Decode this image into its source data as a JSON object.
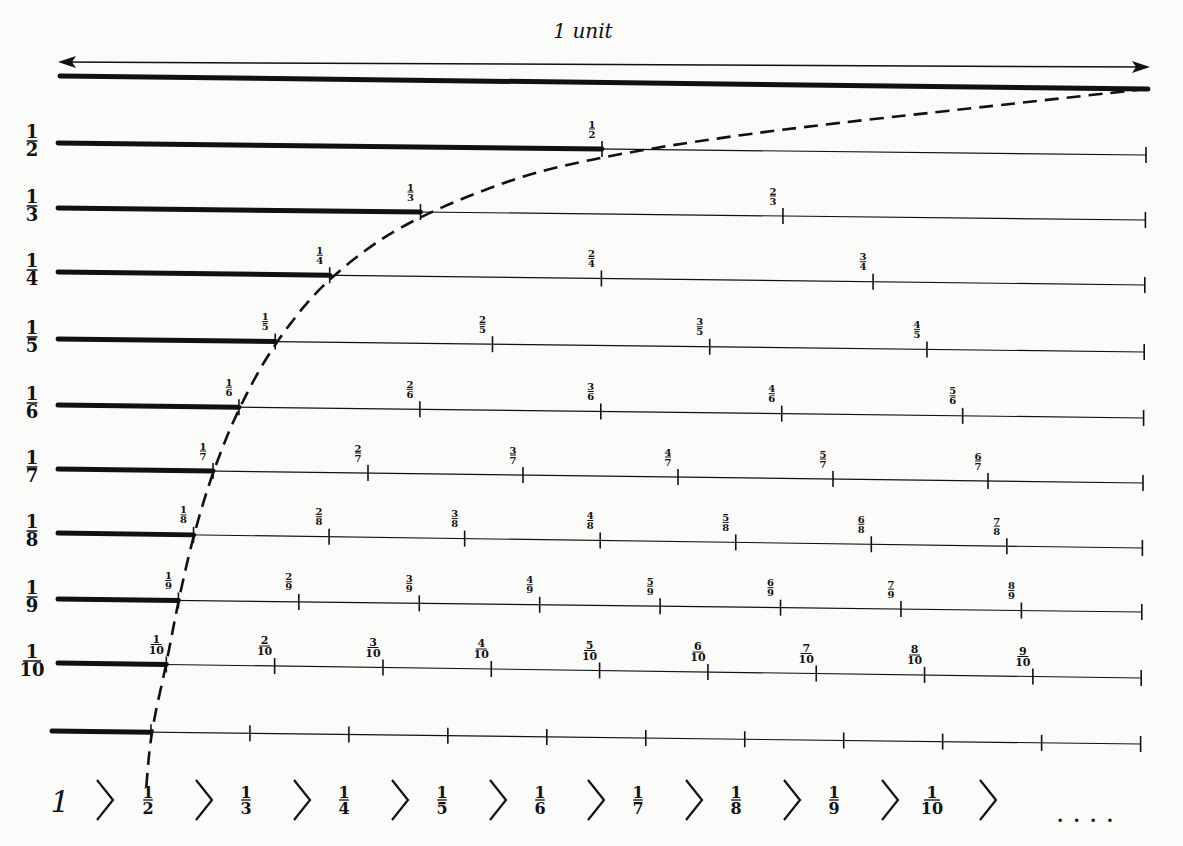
{
  "title": "1 unit",
  "colors": {
    "ink": "#111111",
    "background": "#fbfbfa"
  },
  "rows": [
    {
      "label_num": "1",
      "label_den": "2",
      "y": 143,
      "yR": 155,
      "parts": 2
    },
    {
      "label_num": "1",
      "label_den": "3",
      "y": 208,
      "yR": 220,
      "parts": 3
    },
    {
      "label_num": "1",
      "label_den": "4",
      "y": 272,
      "yR": 285,
      "parts": 4
    },
    {
      "label_num": "1",
      "label_den": "5",
      "y": 339,
      "yR": 352,
      "parts": 5
    },
    {
      "label_num": "1",
      "label_den": "6",
      "y": 405,
      "yR": 418,
      "parts": 6
    },
    {
      "label_num": "1",
      "label_den": "7",
      "y": 469,
      "yR": 483,
      "parts": 7
    },
    {
      "label_num": "1",
      "label_den": "8",
      "y": 533,
      "yR": 548,
      "parts": 8
    },
    {
      "label_num": "1",
      "label_den": "9",
      "y": 599,
      "yR": 612,
      "parts": 9
    },
    {
      "label_num": "1",
      "label_den": "10",
      "y": 663,
      "yR": 678,
      "parts": 10
    },
    {
      "label_num": "",
      "label_den": "",
      "y": 731,
      "yR": 744,
      "parts": 11,
      "unlabeled": true
    }
  ],
  "sequence": {
    "first": "1",
    "items": [
      {
        "num": "1",
        "den": "2"
      },
      {
        "num": "1",
        "den": "3"
      },
      {
        "num": "1",
        "den": "4"
      },
      {
        "num": "1",
        "den": "5"
      },
      {
        "num": "1",
        "den": "6"
      },
      {
        "num": "1",
        "den": "7"
      },
      {
        "num": "1",
        "den": "8"
      },
      {
        "num": "1",
        "den": "9"
      },
      {
        "num": "1",
        "den": "10"
      }
    ],
    "separator": ">",
    "ellipsis": ". . . ."
  }
}
